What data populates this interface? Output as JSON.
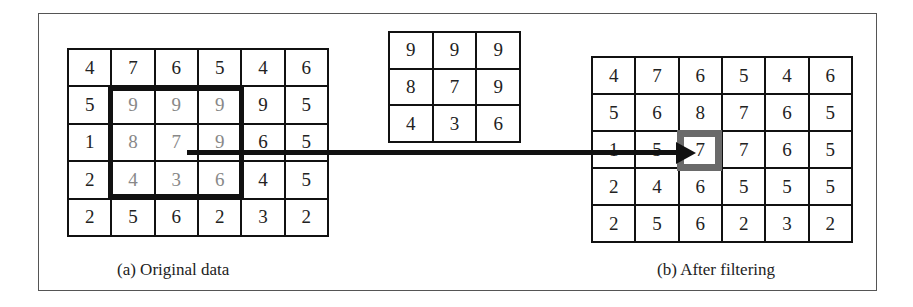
{
  "figure": {
    "original": {
      "caption": "(a) Original data",
      "rows": [
        [
          "4",
          "7",
          "6",
          "5",
          "4",
          "6"
        ],
        [
          "5",
          "9",
          "9",
          "9",
          "9",
          "5"
        ],
        [
          "1",
          "8",
          "7",
          "9",
          "6",
          "5"
        ],
        [
          "2",
          "4",
          "3",
          "6",
          "4",
          "5"
        ],
        [
          "2",
          "5",
          "6",
          "2",
          "3",
          "2"
        ]
      ],
      "window": {
        "row_start": 1,
        "col_start": 1,
        "size": 3
      }
    },
    "kernel_window": {
      "rows": [
        [
          "9",
          "9",
          "9"
        ],
        [
          "8",
          "7",
          "9"
        ],
        [
          "4",
          "3",
          "6"
        ]
      ]
    },
    "filtered": {
      "caption": "(b) After filtering",
      "rows": [
        [
          "4",
          "7",
          "6",
          "5",
          "4",
          "6"
        ],
        [
          "5",
          "6",
          "8",
          "7",
          "6",
          "5"
        ],
        [
          "1",
          "5",
          "7",
          "7",
          "6",
          "5"
        ],
        [
          "2",
          "4",
          "6",
          "5",
          "5",
          "5"
        ],
        [
          "2",
          "5",
          "6",
          "2",
          "3",
          "2"
        ]
      ],
      "highlight": {
        "row": 2,
        "col": 2
      }
    },
    "colors": {
      "grid_line": "#111111",
      "window_inner": "#999999",
      "dim_text": "#888888",
      "highlight_border": "#6a6a6a"
    }
  }
}
